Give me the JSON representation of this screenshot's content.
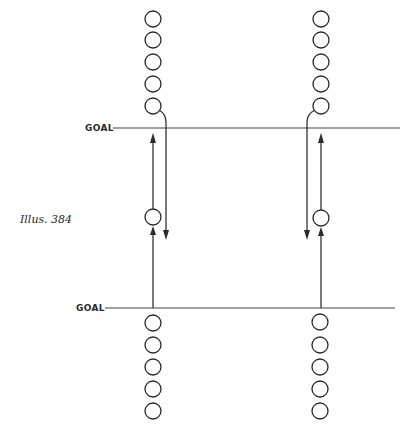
{
  "caption": "Illus. 384",
  "goals": [
    {
      "label": "GOAL",
      "position": "upper"
    },
    {
      "label": "GOAL",
      "position": "lower"
    }
  ],
  "columns": [
    {
      "side": "left",
      "top_players": 5,
      "middle_players": 1,
      "bottom_players": 5
    },
    {
      "side": "right",
      "top_players": 5,
      "middle_players": 1,
      "bottom_players": 5
    }
  ],
  "colors": {
    "ink": "#2a2a2a",
    "background": "#ffffff"
  }
}
